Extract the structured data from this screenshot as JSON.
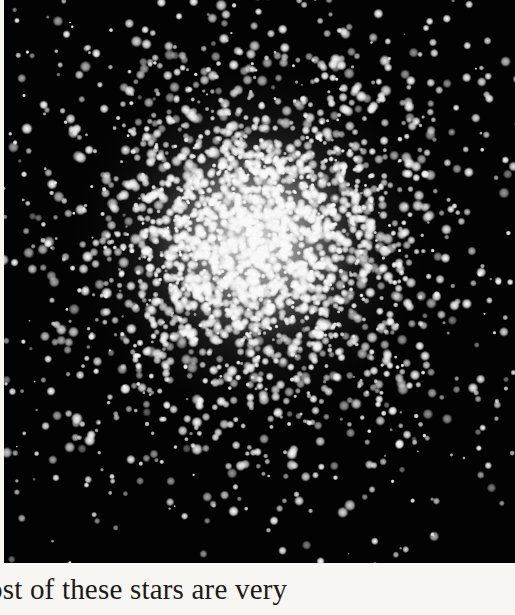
{
  "page": {
    "background": "#f7f6f3"
  },
  "photo": {
    "subject": "globular star cluster",
    "background_color": "#030303",
    "star_color": "#ffffff",
    "core_center": {
      "x": 250,
      "y": 240
    },
    "core_radius": 70,
    "halo_radius": 190,
    "star_count_dense": 2600,
    "star_count_field": 260,
    "seed": 7
  },
  "caption": {
    "text": "ost of these stars are very"
  }
}
